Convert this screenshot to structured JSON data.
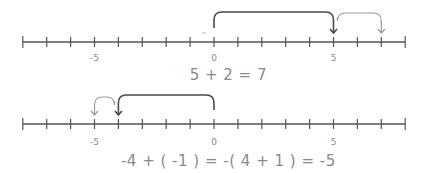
{
  "diagram": {
    "colors": {
      "axis": "#555555",
      "primary_arc": "#4a4a4a",
      "secondary_arc": "#9a9a9a",
      "label": "#8a8a8a",
      "text": "#8a8a8a"
    },
    "axis_range": [
      -8,
      8
    ],
    "pixel": {
      "origin_x": 214,
      "unit": 23.9
    },
    "number_lines": [
      {
        "id": "top",
        "y": 42,
        "tick_labels": [
          {
            "value": -5,
            "text": "-5"
          },
          {
            "value": 0,
            "text": "0"
          },
          {
            "value": 5,
            "text": "5"
          }
        ],
        "label_y": 57,
        "jumps": [
          {
            "from": 0,
            "to": 5,
            "style": "primary",
            "top_y": 12
          },
          {
            "from": 5,
            "to": 7,
            "style": "secondary",
            "top_y": 13
          }
        ],
        "equation": "5 + 2 = 7",
        "equation_y": 75
      },
      {
        "id": "bottom",
        "y": 124,
        "tick_labels": [
          {
            "value": -5,
            "text": "-5"
          },
          {
            "value": 0,
            "text": "0"
          },
          {
            "value": 5,
            "text": "5"
          }
        ],
        "label_y": 141,
        "jumps": [
          {
            "from": 0,
            "to": -4,
            "style": "primary",
            "top_y": 95
          },
          {
            "from": -4,
            "to": -5,
            "style": "secondary",
            "top_y": 97
          }
        ],
        "equation": "-4 + ( -1 ) = -( 4 + 1 ) = -5",
        "equation_y": 161
      }
    ]
  }
}
